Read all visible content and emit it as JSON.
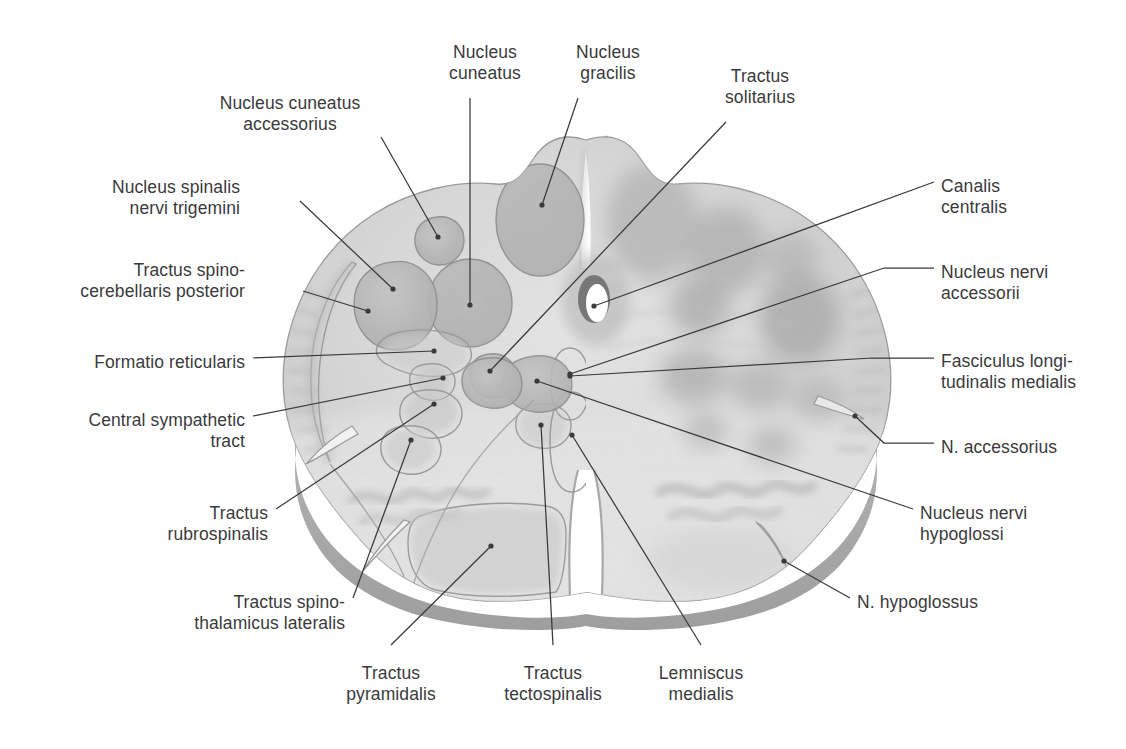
{
  "figure": {
    "colors": {
      "background": "#ffffff",
      "label_text": "#3a3a3c",
      "leader_line": "#3a3a3c",
      "tissue_base": "#d4d4d4",
      "tissue_light": "#e2e2e2",
      "nucleus_fill": "#b9b9b9",
      "nucleus_stroke": "#8e8e8e",
      "outline_stroke": "#9a9a9a",
      "shadow_rim": "#9c9c9c",
      "central_canal": "#ffffff"
    }
  },
  "labels": [
    {
      "id": "nucleus-cuneatus",
      "lines": [
        "Nucleus",
        "cuneatus"
      ],
      "align": "c",
      "x": 485,
      "y": 42
    },
    {
      "id": "nucleus-gracilis",
      "lines": [
        "Nucleus",
        "gracilis"
      ],
      "align": "c",
      "x": 608,
      "y": 42
    },
    {
      "id": "tractus-solitarius",
      "lines": [
        "Tractus",
        "solitarius"
      ],
      "align": "c",
      "x": 760,
      "y": 66
    },
    {
      "id": "nucleus-cuneatus-accessorius",
      "lines": [
        "Nucleus cuneatus",
        "accessorius"
      ],
      "align": "c",
      "x": 290,
      "y": 93
    },
    {
      "id": "canalis-centralis",
      "lines": [
        "Canalis",
        "centralis"
      ],
      "align": "r",
      "x": 941,
      "y": 176
    },
    {
      "id": "nucleus-spinalis-nervi-trigemini",
      "lines": [
        "Nucleus spinalis",
        "nervi trigemini"
      ],
      "align": "l",
      "x": 240,
      "y": 177
    },
    {
      "id": "nucleus-nervi-accessorii",
      "lines": [
        "Nucleus nervi",
        "accessorii"
      ],
      "align": "r",
      "x": 941,
      "y": 262
    },
    {
      "id": "tractus-spinocerebellaris-post",
      "lines": [
        "Tractus spino-",
        "cerebellaris posterior"
      ],
      "align": "l",
      "x": 245,
      "y": 260
    },
    {
      "id": "formatio-reticularis",
      "lines": [
        "Formatio reticularis"
      ],
      "align": "l",
      "x": 245,
      "y": 352
    },
    {
      "id": "fasciculus-longitudinalis-med",
      "lines": [
        "Fasciculus longi-",
        "tudinalis medialis"
      ],
      "align": "r",
      "x": 941,
      "y": 351
    },
    {
      "id": "central-sympathetic-tract",
      "lines": [
        "Central sympathetic",
        "tract"
      ],
      "align": "l",
      "x": 245,
      "y": 410
    },
    {
      "id": "n-accessorius",
      "lines": [
        "N. accessorius"
      ],
      "align": "r",
      "x": 941,
      "y": 437
    },
    {
      "id": "tractus-rubrospinalis",
      "lines": [
        "Tractus",
        "rubrospinalis"
      ],
      "align": "l",
      "x": 268,
      "y": 503
    },
    {
      "id": "nucleus-nervi-hypoglossi",
      "lines": [
        "Nucleus nervi",
        "hypoglossi"
      ],
      "align": "r",
      "x": 920,
      "y": 503
    },
    {
      "id": "tractus-spinothalamicus-lat",
      "lines": [
        "Tractus spino-",
        "thalamicus lateralis"
      ],
      "align": "l",
      "x": 345,
      "y": 592
    },
    {
      "id": "n-hypoglossus",
      "lines": [
        "N. hypoglossus"
      ],
      "align": "r",
      "x": 857,
      "y": 592
    },
    {
      "id": "tractus-pyramidalis",
      "lines": [
        "Tractus",
        "pyramidalis"
      ],
      "align": "c",
      "x": 391,
      "y": 663
    },
    {
      "id": "tractus-tectospinalis",
      "lines": [
        "Tractus",
        "tectospinalis"
      ],
      "align": "c",
      "x": 553,
      "y": 663
    },
    {
      "id": "lemniscus-medialis",
      "lines": [
        "Lemniscus",
        "medialis"
      ],
      "align": "c",
      "x": 701,
      "y": 663
    }
  ],
  "leaders": [
    {
      "id": "leader-nucleus-cuneatus",
      "d": "M 470,98 L 470,305",
      "dot": [
        470,
        305
      ]
    },
    {
      "id": "leader-nucleus-gracilis",
      "d": "M 578,98 L 542,205",
      "dot": [
        542,
        205
      ]
    },
    {
      "id": "leader-tractus-solitarius",
      "d": "M 726,122 L 490,371",
      "dot": [
        490,
        371
      ]
    },
    {
      "id": "leader-nucleus-cuneatus-accessorius",
      "d": "M 381,137 L 438,237",
      "dot": [
        438,
        237
      ]
    },
    {
      "id": "leader-canalis-centralis",
      "d": "M 934,182 L 594,306",
      "dot": [
        594,
        306
      ]
    },
    {
      "id": "leader-nucleus-spinalis",
      "d": "M 300,201 L 393,289",
      "dot": [
        393,
        289
      ]
    },
    {
      "id": "leader-nucleus-nervi-accessorii",
      "d": "M 934,268 L 884,268 L 570,374",
      "dot": [
        570,
        374
      ]
    },
    {
      "id": "leader-tractus-spinocerebellaris",
      "d": "M 303,291 L 368,311",
      "dot": [
        368,
        311
      ]
    },
    {
      "id": "leader-formatio-reticularis",
      "d": "M 253,358 L 434,351",
      "dot": [
        434,
        351
      ]
    },
    {
      "id": "leader-fasciculus-longitudinalis",
      "d": "M 934,358 L 872,358 L 570,376",
      "dot": [
        570,
        376
      ]
    },
    {
      "id": "leader-central-sympathetic",
      "d": "M 253,416 L 443,378",
      "dot": [
        443,
        378
      ]
    },
    {
      "id": "leader-n-accessorius",
      "d": "M 934,443 L 884,443 L 855,416",
      "dot": [
        855,
        416
      ]
    },
    {
      "id": "leader-tractus-rubrospinalis",
      "d": "M 276,509 L 434,404",
      "dot": [
        434,
        404
      ]
    },
    {
      "id": "leader-nucleus-nervi-hypoglossi",
      "d": "M 913,509 L 537,381",
      "dot": [
        537,
        381
      ]
    },
    {
      "id": "leader-tractus-spinothalamicus",
      "d": "M 353,598 L 411,440",
      "dot": [
        411,
        440
      ]
    },
    {
      "id": "leader-n-hypoglossus",
      "d": "M 850,598 L 784,561",
      "dot": [
        784,
        561
      ]
    },
    {
      "id": "leader-tractus-pyramidalis",
      "d": "M 391,645 L 491,546",
      "dot": [
        491,
        546
      ]
    },
    {
      "id": "leader-tractus-tectospinalis",
      "d": "M 553,645 L 541,425",
      "dot": [
        541,
        425
      ]
    },
    {
      "id": "leader-lemniscus-medialis",
      "d": "M 701,645 L 572,435",
      "dot": [
        572,
        435
      ]
    }
  ]
}
